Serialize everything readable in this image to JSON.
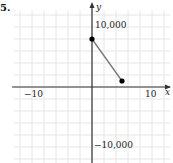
{
  "problem_number": "5.",
  "chart_data": {
    "type": "line",
    "title": "",
    "xlabel": "x",
    "ylabel": "y",
    "xlim": [
      -15,
      13.5
    ],
    "ylim": [
      -12500,
      14500
    ],
    "grid": true,
    "x_ticks_labeled": [
      {
        "value": -10,
        "label": "−10"
      },
      {
        "value": 10,
        "label": "10"
      }
    ],
    "y_ticks_labeled": [
      {
        "value": 10000,
        "label": "10,000"
      },
      {
        "value": -10000,
        "label": "−10,000"
      }
    ],
    "grid_step": {
      "x": 2,
      "y": 2000
    },
    "series": [
      {
        "name": "segment",
        "points": [
          {
            "x": 0,
            "y": 8000
          },
          {
            "x": 5,
            "y": 1000
          }
        ],
        "line_color": "#777777",
        "marker": "filled-circle",
        "marker_color": "#000000"
      }
    ]
  },
  "labels": {
    "x_axis": "x",
    "y_axis": "y",
    "x_neg": "−10",
    "x_pos": "10",
    "y_pos": "10,000",
    "y_neg": "−10,000"
  }
}
